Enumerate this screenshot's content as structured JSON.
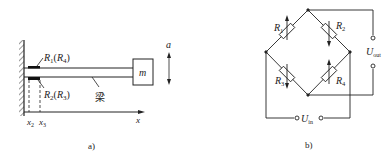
{
  "panel_a": {
    "caption": "a)",
    "gauge_top_label": "R",
    "gauge_top_sub1": "1",
    "gauge_top_paren": "(R",
    "gauge_top_sub2": "4",
    "gauge_top_close": ")",
    "gauge_bottom_label": "R",
    "gauge_bottom_sub1": "2",
    "gauge_bottom_paren": "(R",
    "gauge_bottom_sub2": "3",
    "gauge_bottom_close": ")",
    "beam_label": "梁",
    "mass_label": "m",
    "accel_label": "a",
    "x2_label": "x",
    "x2_sub": "2",
    "x3_label": "x",
    "x3_sub": "3",
    "axis_label": "x"
  },
  "panel_b": {
    "caption": "b)",
    "r1_label": "R",
    "r1_sub": "1",
    "r2_label": "R",
    "r2_sub": "2",
    "r3_label": "R",
    "r3_sub": "3",
    "r4_label": "R",
    "r4_sub": "4",
    "uout_label": "U",
    "uout_sub": "out",
    "uin_label": "U",
    "uin_sub": "in"
  }
}
